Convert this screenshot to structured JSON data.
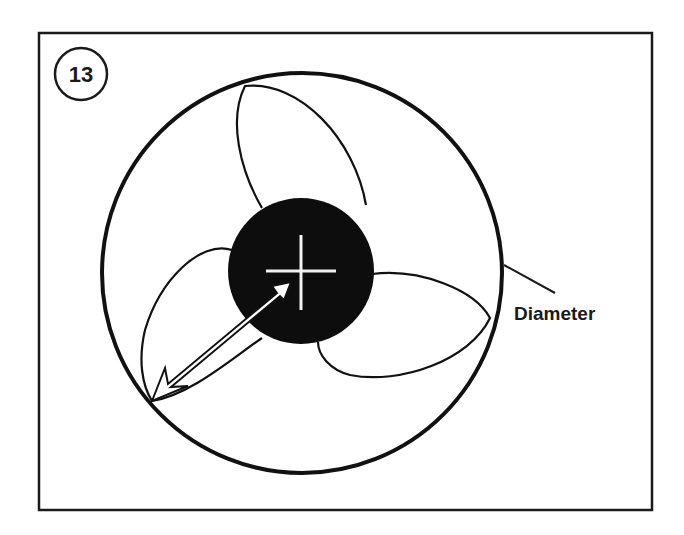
{
  "figure": {
    "step_number": "13",
    "callout_label": "Diameter",
    "colors": {
      "line": "#1a1a1a",
      "hub_fill": "#0d0d0d",
      "background": "#ffffff",
      "crosshair": "#f2f2f2"
    },
    "elements": {
      "frame": "rectangular border frame",
      "outer_circle": "fan swept circle",
      "blades": [
        "top blade",
        "right blade",
        "left blade"
      ],
      "hub": "solid black hub with white center crosshair",
      "measurement_arrow": "double-headed arrow from blade tip to hub center (radius)",
      "leader_line": "line from outer circle to Diameter label"
    }
  }
}
